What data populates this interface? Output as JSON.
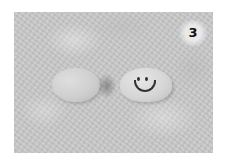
{
  "image": {
    "description": "Photo of two smooth stones on textured grey surface; right stone has a drawn smiley face",
    "badge_number": "3",
    "colors": {
      "background": "#c8c8c8",
      "stone": "#d6d6d6",
      "ink": "#333333",
      "badge_text": "#111111",
      "page": "#ffffff"
    }
  }
}
